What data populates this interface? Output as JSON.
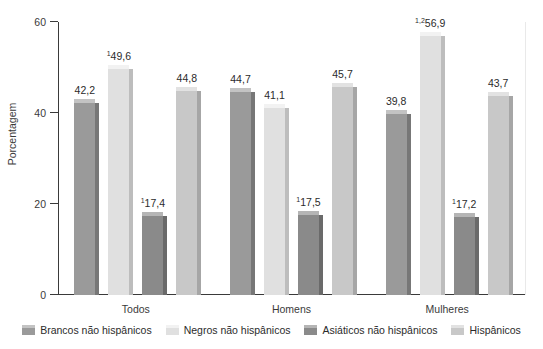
{
  "chart_data": {
    "type": "bar",
    "title": "",
    "xlabel": "",
    "ylabel": "Porcentagem",
    "ylim": [
      0,
      60
    ],
    "yticks": [
      0,
      20,
      40,
      60
    ],
    "ytick_labels": [
      "0",
      "20",
      "40",
      "60"
    ],
    "grid": false,
    "legend_position": "bottom",
    "categories": [
      "Todos",
      "Homens",
      "Mulheres"
    ],
    "series": [
      {
        "name": "Brancos não hispânicos",
        "color": "#9a9a9a",
        "values": [
          42.2,
          44.7,
          39.8
        ],
        "labels": [
          "42,2",
          "44,7",
          "39,8"
        ],
        "superscripts": [
          "",
          "",
          ""
        ]
      },
      {
        "name": "Negros não hispânicos",
        "color": "#e0e0e0",
        "values": [
          49.6,
          41.1,
          56.9
        ],
        "labels": [
          "49,6",
          "41,1",
          "56,9"
        ],
        "superscripts": [
          "1",
          "",
          "1,2"
        ]
      },
      {
        "name": "Asiáticos não hispânicos",
        "color": "#8a8a8a",
        "values": [
          17.4,
          17.5,
          17.2
        ],
        "labels": [
          "17,4",
          "17,5",
          "17,2"
        ],
        "superscripts": [
          "1",
          "1",
          "1"
        ]
      },
      {
        "name": "Hispânicos",
        "color": "#c8c8c8",
        "values": [
          44.8,
          45.7,
          43.7
        ],
        "labels": [
          "44,8",
          "45,7",
          "43,7"
        ],
        "superscripts": [
          "",
          "",
          ""
        ]
      }
    ]
  },
  "axis": {
    "y_label": "Porcentagem",
    "ticks": [
      {
        "value": "60"
      },
      {
        "value": "40"
      },
      {
        "value": "20"
      },
      {
        "value": "0"
      }
    ]
  },
  "groups": [
    {
      "label": "Todos"
    },
    {
      "label": "Homens"
    },
    {
      "label": "Mulheres"
    }
  ],
  "legend": {
    "items": [
      {
        "label": "Brancos não hispânicos"
      },
      {
        "label": "Negros não hispânicos"
      },
      {
        "label": "Asiáticos não hispânicos"
      },
      {
        "label": "Hispânicos"
      }
    ]
  },
  "footnote": {
    "text": ""
  }
}
